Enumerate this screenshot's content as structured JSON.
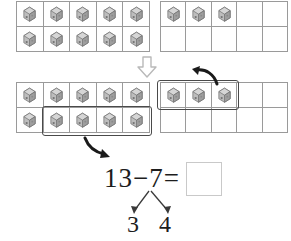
{
  "worksheet": {
    "type": "subtraction-make-ten-worksheet",
    "equation": {
      "minuend": "13",
      "operator": "−",
      "subtrahend": "7",
      "equals": "=",
      "full_text": "13−7=",
      "answer_value": ""
    },
    "number_bond": {
      "whole": "7",
      "part_left": "3",
      "part_right": "4"
    },
    "colors": {
      "frame_line": "#9a9a9a",
      "ring_stroke": "#4a4a4a",
      "arrow_fill": "#1a1a1a",
      "down_arrow_stroke": "#b9b9b9",
      "answer_box_border": "#c9c9c9",
      "cube_body": "#b5b5b5",
      "text": "#1d1d1d"
    },
    "rows": [
      {
        "id": "row-1",
        "label": "initial-quantity",
        "frames": [
          {
            "id": "frame-1a",
            "label": "ten-frame-full",
            "rows": [
              5,
              5
            ],
            "filled_cells": [
              [
                1,
                1,
                1,
                1,
                1
              ],
              [
                1,
                1,
                1,
                1,
                1
              ]
            ],
            "count": 10
          },
          {
            "id": "frame-1b",
            "label": "ten-frame-partial",
            "rows": [
              5,
              5
            ],
            "filled_cells": [
              [
                1,
                1,
                1,
                0,
                0
              ],
              [
                0,
                0,
                0,
                0,
                0
              ]
            ],
            "count": 3
          }
        ],
        "total": "13"
      },
      {
        "id": "row-2",
        "label": "decomposed-subtraction",
        "frames": [
          {
            "id": "frame-2a",
            "label": "ten-frame-full-with-group",
            "rows": [
              5,
              5
            ],
            "filled_cells": [
              [
                1,
                1,
                1,
                1,
                1
              ],
              [
                1,
                1,
                1,
                1,
                1
              ]
            ],
            "count": 10,
            "group_count": 4,
            "group_note": "bottom row cells 2-5 circled"
          },
          {
            "id": "frame-2b",
            "label": "ten-frame-partial-with-group",
            "rows": [
              5,
              5
            ],
            "filled_cells": [
              [
                1,
                1,
                1,
                0,
                0
              ],
              [
                0,
                0,
                0,
                0,
                0
              ]
            ],
            "count": 3,
            "group_count": 3,
            "group_note": "top row cells 1-3 circled"
          }
        ]
      }
    ],
    "arrows": [
      {
        "id": "arrow-down",
        "label": "transition-down-arrow",
        "direction": "down"
      },
      {
        "id": "arrow-take-right",
        "label": "take-three-arrow",
        "direction": "up-left"
      },
      {
        "id": "arrow-take-left",
        "label": "take-four-arrow",
        "direction": "down-right"
      },
      {
        "id": "bond-branch-left",
        "label": "bond-branch-to-3",
        "direction": "down-left"
      },
      {
        "id": "bond-branch-right",
        "label": "bond-branch-to-4",
        "direction": "down-right"
      }
    ]
  }
}
